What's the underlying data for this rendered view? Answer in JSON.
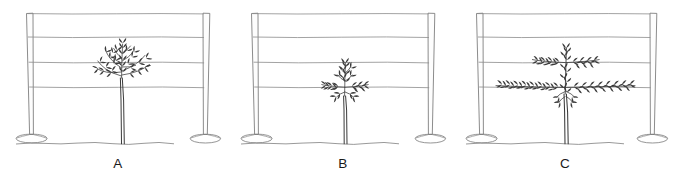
{
  "figure": {
    "title": "",
    "background_color": "#ffffff",
    "line_color": "#6e6e6e",
    "plant_color": "#3a3a3a",
    "label_color": "#1a1a1a",
    "panel_count": 3
  },
  "panels": [
    {
      "id": "panel-a",
      "label": "A",
      "trellis": {
        "post_count": 2,
        "wire_count": 4,
        "wire_labels": [
          "top wire",
          "third wire",
          "second wire",
          "fruiting wire"
        ]
      },
      "plant": {
        "name": "untrained bushy vine",
        "training_stage": "unpruned / bushy growth",
        "trunk": "single vertical trunk",
        "canopy_description": "broad bushy canopy of leafy shoots spreading above and around the lowest wire",
        "canopy_width": "wide",
        "canopy_height": "tall",
        "cordons": "none",
        "reaches_wire": "fruiting wire"
      }
    },
    {
      "id": "panel-b",
      "label": "B",
      "trellis": {
        "post_count": 2,
        "wire_count": 4,
        "wire_labels": [
          "top wire",
          "third wire",
          "second wire",
          "fruiting wire"
        ]
      },
      "plant": {
        "name": "young narrow vine",
        "training_stage": "newly trained / short arms",
        "trunk": "single vertical trunk",
        "canopy_description": "narrow compact canopy with short horizontal arms beginning along the fruiting wire",
        "canopy_width": "narrow",
        "canopy_height": "short",
        "cordons": "short, just starting",
        "reaches_wire": "fruiting wire"
      }
    },
    {
      "id": "panel-c",
      "label": "C",
      "trellis": {
        "post_count": 2,
        "wire_count": 4,
        "wire_labels": [
          "top wire",
          "third wire",
          "second wire",
          "fruiting wire"
        ]
      },
      "plant": {
        "name": "established trained vine",
        "training_stage": "fully trained cordons",
        "trunk": "single vertical trunk",
        "canopy_description": "long horizontal cordons extending both ways along the fruiting wire with shorter leafy arms on the second wire",
        "canopy_width": "very wide",
        "canopy_height": "medium",
        "cordons": "long bilateral cordons",
        "reaches_wire": "second wire"
      }
    }
  ]
}
